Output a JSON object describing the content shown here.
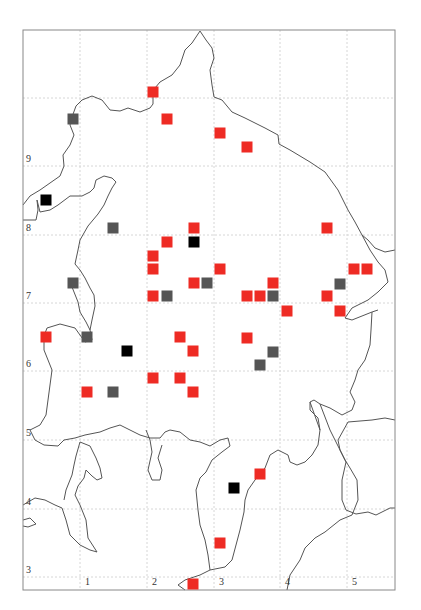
{
  "map": {
    "frame": {
      "x": 23,
      "y": 30,
      "w": 372,
      "h": 560
    },
    "colors": {
      "frame": "#888888",
      "grid": "#d6d6d6",
      "coast": "#555555",
      "red": "#ee2b24",
      "gray": "#555555",
      "black": "#000000"
    },
    "x_axis": {
      "ticks": [
        {
          "label": "1",
          "grid_x": 80
        },
        {
          "label": "2",
          "grid_x": 147
        },
        {
          "label": "3",
          "grid_x": 214
        },
        {
          "label": "4",
          "grid_x": 280
        },
        {
          "label": "5",
          "grid_x": 347
        }
      ]
    },
    "y_axis": {
      "ticks": [
        {
          "label": "",
          "grid_y": 98
        },
        {
          "label": "9",
          "grid_y": 166
        },
        {
          "label": "8",
          "grid_y": 235
        },
        {
          "label": "7",
          "grid_y": 303
        },
        {
          "label": "6",
          "grid_y": 371
        },
        {
          "label": "5",
          "grid_y": 440
        },
        {
          "label": "4",
          "grid_y": 509
        },
        {
          "label": "3",
          "grid_y": 577
        }
      ]
    },
    "marker_size": 11,
    "markers": [
      {
        "type": "red",
        "x": 153,
        "y": 92
      },
      {
        "type": "gray",
        "x": 73,
        "y": 119
      },
      {
        "type": "red",
        "x": 167,
        "y": 119
      },
      {
        "type": "red",
        "x": 220,
        "y": 133
      },
      {
        "type": "red",
        "x": 247,
        "y": 147
      },
      {
        "type": "black",
        "x": 46,
        "y": 200
      },
      {
        "type": "gray",
        "x": 113,
        "y": 228
      },
      {
        "type": "red",
        "x": 194,
        "y": 228
      },
      {
        "type": "red",
        "x": 327,
        "y": 228
      },
      {
        "type": "red",
        "x": 167,
        "y": 242
      },
      {
        "type": "black",
        "x": 194,
        "y": 242
      },
      {
        "type": "red",
        "x": 153,
        "y": 256
      },
      {
        "type": "red",
        "x": 153,
        "y": 269
      },
      {
        "type": "red",
        "x": 220,
        "y": 269
      },
      {
        "type": "red",
        "x": 354,
        "y": 269
      },
      {
        "type": "red",
        "x": 367,
        "y": 269
      },
      {
        "type": "gray",
        "x": 73,
        "y": 283
      },
      {
        "type": "red",
        "x": 194,
        "y": 283
      },
      {
        "type": "gray",
        "x": 207,
        "y": 283
      },
      {
        "type": "red",
        "x": 273,
        "y": 283
      },
      {
        "type": "gray",
        "x": 340,
        "y": 284
      },
      {
        "type": "red",
        "x": 153,
        "y": 296
      },
      {
        "type": "gray",
        "x": 167,
        "y": 296
      },
      {
        "type": "red",
        "x": 247,
        "y": 296
      },
      {
        "type": "red",
        "x": 260,
        "y": 296
      },
      {
        "type": "gray",
        "x": 273,
        "y": 296
      },
      {
        "type": "red",
        "x": 327,
        "y": 296
      },
      {
        "type": "red",
        "x": 287,
        "y": 311
      },
      {
        "type": "red",
        "x": 340,
        "y": 311
      },
      {
        "type": "red",
        "x": 46,
        "y": 337
      },
      {
        "type": "gray",
        "x": 87,
        "y": 337
      },
      {
        "type": "red",
        "x": 180,
        "y": 337
      },
      {
        "type": "red",
        "x": 247,
        "y": 338
      },
      {
        "type": "black",
        "x": 127,
        "y": 351
      },
      {
        "type": "red",
        "x": 193,
        "y": 351
      },
      {
        "type": "gray",
        "x": 273,
        "y": 352
      },
      {
        "type": "gray",
        "x": 260,
        "y": 365
      },
      {
        "type": "red",
        "x": 153,
        "y": 378
      },
      {
        "type": "red",
        "x": 180,
        "y": 378
      },
      {
        "type": "red",
        "x": 87,
        "y": 392
      },
      {
        "type": "gray",
        "x": 113,
        "y": 392
      },
      {
        "type": "red",
        "x": 193,
        "y": 392
      },
      {
        "type": "red",
        "x": 260,
        "y": 474
      },
      {
        "type": "black",
        "x": 234,
        "y": 488
      },
      {
        "type": "red",
        "x": 220,
        "y": 543
      },
      {
        "type": "red",
        "x": 193,
        "y": 584
      }
    ]
  }
}
